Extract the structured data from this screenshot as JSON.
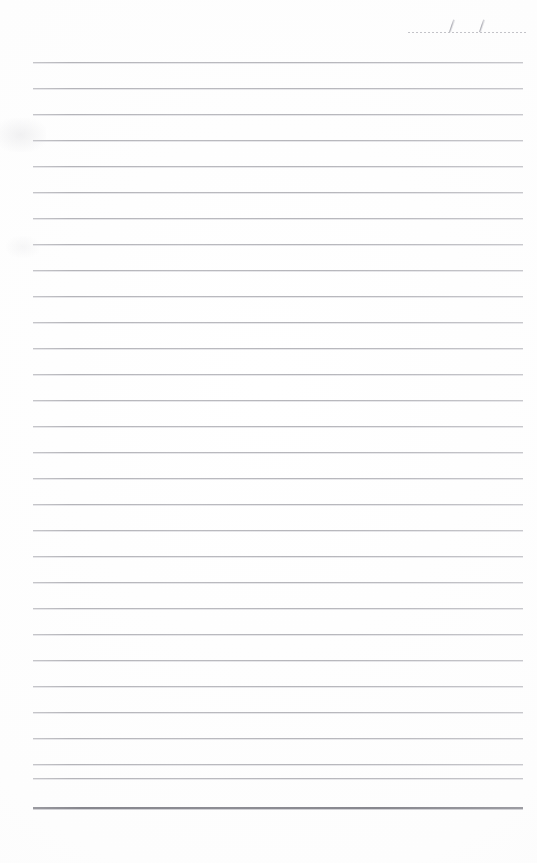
{
  "page": {
    "kind": "lined-notepaper-sheet",
    "width": 537,
    "height": 863,
    "background_color": "#fefefe",
    "content_text": ""
  },
  "date_field": {
    "label": "",
    "value": "",
    "placeholder": "",
    "separator_1": "/",
    "separator_2": "/",
    "rule_style": "dotted",
    "rule_color": "#c3c3c8",
    "left": 406,
    "top": 10,
    "width": 122
  },
  "ruled_lines": {
    "count": 29,
    "first_y": 62,
    "spacing": 26,
    "left": 33,
    "right": 523,
    "width": 490,
    "color": "#b8b8bc",
    "thickness": 1,
    "y_positions": [
      62,
      88,
      114,
      140,
      166,
      192,
      218,
      244,
      270,
      296,
      322,
      348,
      374,
      400,
      426,
      452,
      478,
      504,
      530,
      556,
      582,
      608,
      634,
      660,
      686,
      712,
      738,
      764,
      778
    ],
    "text": [
      "",
      "",
      "",
      "",
      "",
      "",
      "",
      "",
      "",
      "",
      "",
      "",
      "",
      "",
      "",
      "",
      "",
      "",
      "",
      "",
      "",
      "",
      "",
      "",
      "",
      "",
      "",
      "",
      ""
    ]
  },
  "bottom_rule": {
    "y": 807,
    "left": 33,
    "width": 490,
    "thickness": 2,
    "color": "#8c8c93"
  },
  "artifacts": {
    "smudge_1": {
      "x": 0,
      "y": 118,
      "width": 46,
      "height": 34
    },
    "smudge_2": {
      "x": 6,
      "y": 236,
      "width": 34,
      "height": 22
    }
  }
}
